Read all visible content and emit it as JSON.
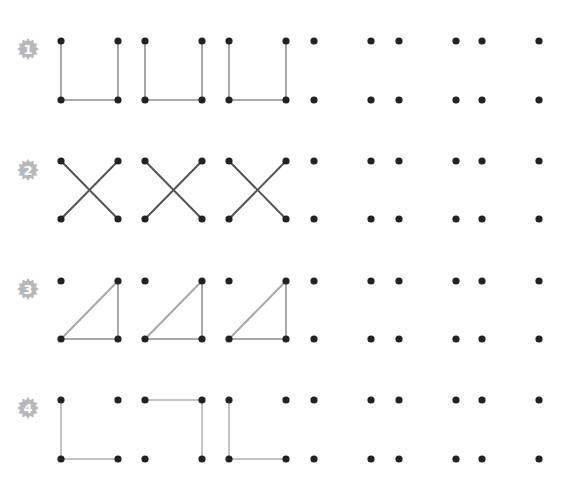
{
  "colors": {
    "dot": "#222222",
    "line_light": "#c4c4c4",
    "line_medium": "#a8a8a8",
    "line_dark": "#555555",
    "badge": "#b8b8b8",
    "badge_text": "#ffffff"
  },
  "columns_x": [
    61,
    118,
    145,
    202,
    229,
    286,
    314,
    371,
    399,
    456,
    482,
    539
  ],
  "rows": [
    {
      "number": "1",
      "top_y": 41,
      "bottom_y": 100,
      "badge_y": 49,
      "pattern": "u-shape",
      "line_color": "line_medium",
      "figures": [
        {
          "lines": [
            [
              "TL",
              "BL"
            ],
            [
              "BL",
              "BR"
            ],
            [
              "BR",
              "TR"
            ]
          ]
        },
        {
          "lines": [
            [
              "TL",
              "BL"
            ],
            [
              "BL",
              "BR"
            ],
            [
              "BR",
              "TR"
            ]
          ]
        },
        {
          "lines": [
            [
              "TL",
              "BL"
            ],
            [
              "BL",
              "BR"
            ],
            [
              "BR",
              "TR"
            ]
          ]
        },
        {
          "lines": []
        },
        {
          "lines": []
        },
        {
          "lines": []
        }
      ]
    },
    {
      "number": "2",
      "top_y": 161,
      "bottom_y": 219,
      "badge_y": 170,
      "pattern": "x-cross",
      "line_color": "line_dark",
      "figures": [
        {
          "lines": [
            [
              "TL",
              "BR"
            ],
            [
              "TR",
              "BL"
            ]
          ]
        },
        {
          "lines": [
            [
              "TL",
              "BR"
            ],
            [
              "TR",
              "BL"
            ]
          ]
        },
        {
          "lines": [
            [
              "TL",
              "BR"
            ],
            [
              "TR",
              "BL"
            ]
          ]
        },
        {
          "lines": []
        },
        {
          "lines": []
        },
        {
          "lines": []
        }
      ]
    },
    {
      "number": "3",
      "top_y": 281,
      "bottom_y": 339,
      "badge_y": 289,
      "pattern": "right-triangle",
      "line_color": "line_medium",
      "figures": [
        {
          "lines": [
            [
              "BL",
              "TR"
            ],
            [
              "TR",
              "BR"
            ],
            [
              "BR",
              "BL"
            ]
          ]
        },
        {
          "lines": [
            [
              "BL",
              "TR"
            ],
            [
              "TR",
              "BR"
            ],
            [
              "BR",
              "BL"
            ]
          ]
        },
        {
          "lines": [
            [
              "BL",
              "TR"
            ],
            [
              "TR",
              "BR"
            ],
            [
              "BR",
              "BL"
            ]
          ]
        },
        {
          "lines": []
        },
        {
          "lines": []
        },
        {
          "lines": []
        }
      ]
    },
    {
      "number": "4",
      "top_y": 400,
      "bottom_y": 459,
      "badge_y": 408,
      "pattern": "alternating-l-shapes",
      "line_color": "line_light",
      "figures": [
        {
          "lines": [
            [
              "TL",
              "BL"
            ],
            [
              "BL",
              "BR"
            ]
          ]
        },
        {
          "lines": [
            [
              "TL",
              "TR"
            ],
            [
              "TR",
              "BR"
            ]
          ]
        },
        {
          "lines": [
            [
              "TL",
              "BL"
            ],
            [
              "BL",
              "BR"
            ]
          ]
        },
        {
          "lines": []
        },
        {
          "lines": []
        },
        {
          "lines": []
        }
      ]
    }
  ]
}
